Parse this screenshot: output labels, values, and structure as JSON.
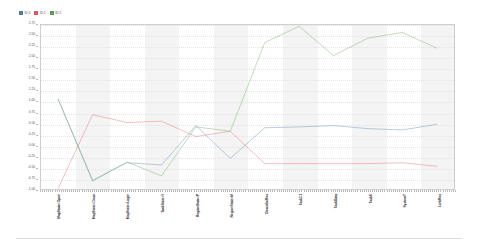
{
  "legend": {
    "position": "top-left",
    "entries": [
      {
        "label": "ID 0",
        "color": "#4e79a7"
      },
      {
        "label": "ID 1",
        "color": "#e15759"
      },
      {
        "label": "ID 2",
        "color": "#59a14f"
      }
    ]
  },
  "chart_data": {
    "type": "line",
    "title": "",
    "subtitle": "",
    "xlabel": "",
    "ylabel": "",
    "grid": true,
    "legend_position": "top-left",
    "ylim": [
      -1.0,
      2.75
    ],
    "ytick_labels": [
      "2.75",
      "2.50",
      "2.25",
      "2.00",
      "1.75",
      "1.50",
      "1.25",
      "1.00",
      "0.75",
      "0.50",
      "0.25",
      "0.00",
      "-0.25",
      "-0.50",
      "-0.75",
      "-1.00"
    ],
    "ytick_values": [
      2.75,
      2.5,
      2.25,
      2.0,
      1.75,
      1.5,
      1.25,
      1.0,
      0.75,
      0.5,
      0.25,
      0.0,
      -0.25,
      -0.5,
      -0.75,
      -1.0
    ],
    "categories": [
      "MapState=Open",
      "MapState=Close",
      "MapState=Login",
      "TaskState=0",
      "RegionState=P",
      "RegionState=M",
      "DescribeRes",
      "TaskC1",
      "TaskData",
      "TaskS",
      "SystemT",
      "LinkRes"
    ],
    "series": [
      {
        "name": "ID 0",
        "color": "#4e79a7",
        "values": [
          1.05,
          -0.8,
          -0.4,
          -0.45,
          0.45,
          -0.3,
          0.4,
          0.42,
          0.45,
          0.38,
          0.35,
          0.48
        ]
      },
      {
        "name": "ID 1",
        "color": "#e15759",
        "values": [
          -0.98,
          0.7,
          0.52,
          0.55,
          0.2,
          0.32,
          -0.42,
          -0.42,
          -0.42,
          -0.42,
          -0.4,
          -0.48
        ]
      },
      {
        "name": "ID 2",
        "color": "#59a14f",
        "values": [
          1.05,
          -0.82,
          -0.38,
          -0.7,
          0.42,
          0.32,
          2.35,
          2.72,
          2.05,
          2.45,
          2.58,
          2.22
        ]
      }
    ]
  }
}
